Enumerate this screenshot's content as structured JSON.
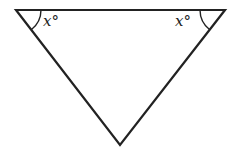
{
  "figure": {
    "type": "triangle",
    "orientation": "inverted",
    "vertices": {
      "top_left": [
        16,
        10
      ],
      "top_right": [
        225,
        10
      ],
      "bottom": [
        120,
        145
      ]
    },
    "stroke_color": "#222222",
    "angles": [
      {
        "vertex": "top_left",
        "label": "x°"
      },
      {
        "vertex": "top_right",
        "label": "x°"
      }
    ]
  }
}
